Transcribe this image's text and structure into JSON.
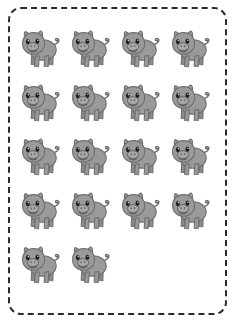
{
  "page": {
    "background_color": "#ffffff",
    "width": 236,
    "height": 323
  },
  "frame": {
    "style": "dashed",
    "shape": "rounded-rectangle",
    "stroke_color": "#2b2b2b",
    "stroke_width_px": 2,
    "corner_radius_px": 13,
    "dash_length_px": 10,
    "dash_gap_px": 5
  },
  "illustration": {
    "subject": "pig",
    "subject_label": "pig",
    "total_count": 18,
    "body_color": "#9a9a9a",
    "body_shade_color": "#8b8b8b",
    "outline_color": "#6f6f6f",
    "snout_color": "#ababab",
    "eye_color": "#1d1d1d",
    "mouth_color": "#5e5e5e",
    "nostril_color": "#6a6a6a"
  },
  "grid": {
    "columns": 4,
    "rows": 5,
    "cell_width_px": 44,
    "cell_height_px": 47,
    "rows_data": [
      {
        "row_label": "row-1",
        "count": 4
      },
      {
        "row_label": "row-2",
        "count": 4
      },
      {
        "row_label": "row-3",
        "count": 4
      },
      {
        "row_label": "row-4",
        "count": 4
      },
      {
        "row_label": "row-5",
        "count": 2
      }
    ]
  },
  "accessibility": {
    "alt_text": "Eighteen gray cartoon pigs arranged in a grid inside a dashed rounded border"
  }
}
